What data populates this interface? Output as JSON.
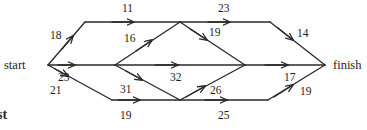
{
  "diagram": {
    "stroke_color": "#2a2a2a",
    "background_color": "#ffffff",
    "nodes": [
      {
        "id": "start",
        "label": "start",
        "x": 48,
        "y": 65
      },
      {
        "id": "top_left",
        "label": "",
        "x": 85,
        "y": 22
      },
      {
        "id": "mid_left",
        "label": "",
        "x": 115,
        "y": 65
      },
      {
        "id": "bottom_left",
        "label": "",
        "x": 112,
        "y": 100
      },
      {
        "id": "top_mid",
        "label": "",
        "x": 180,
        "y": 22
      },
      {
        "id": "bottom_mid",
        "label": "",
        "x": 180,
        "y": 100
      },
      {
        "id": "mid_right",
        "label": "",
        "x": 245,
        "y": 65
      },
      {
        "id": "top_right",
        "label": "",
        "x": 270,
        "y": 22
      },
      {
        "id": "bottom_right",
        "label": "",
        "x": 268,
        "y": 100
      },
      {
        "id": "finish",
        "label": "finish",
        "x": 325,
        "y": 65
      }
    ],
    "edges": [
      {
        "id": "e18",
        "from": "start",
        "to": "top_left",
        "weight": "18",
        "label_x": 50,
        "label_y": 30
      },
      {
        "id": "e23a",
        "from": "start",
        "to": "mid_left",
        "weight": "23",
        "label_x": 58,
        "label_y": 72
      },
      {
        "id": "e21",
        "from": "start",
        "to": "bottom_left",
        "weight": "21",
        "label_x": 50,
        "label_y": 85
      },
      {
        "id": "e11",
        "from": "top_left",
        "to": "top_mid",
        "weight": "11",
        "label_x": 122,
        "label_y": 3
      },
      {
        "id": "e16",
        "from": "mid_left",
        "to": "top_mid",
        "weight": "16",
        "label_x": 124,
        "label_y": 33
      },
      {
        "id": "e32",
        "from": "mid_left",
        "to": "mid_right",
        "weight": "32",
        "label_x": 170,
        "label_y": 72
      },
      {
        "id": "e31",
        "from": "mid_left",
        "to": "bottom_mid",
        "weight": "31",
        "label_x": 120,
        "label_y": 84
      },
      {
        "id": "e19b",
        "from": "bottom_left",
        "to": "bottom_mid",
        "weight": "19",
        "label_x": 120,
        "label_y": 110
      },
      {
        "id": "e23b",
        "from": "top_mid",
        "to": "top_right",
        "weight": "23",
        "label_x": 218,
        "label_y": 3
      },
      {
        "id": "e19a",
        "from": "top_mid",
        "to": "mid_right",
        "weight": "19",
        "label_x": 209,
        "label_y": 27
      },
      {
        "id": "e26",
        "from": "bottom_mid",
        "to": "mid_right",
        "weight": "26",
        "label_x": 210,
        "label_y": 85
      },
      {
        "id": "e25",
        "from": "bottom_mid",
        "to": "bottom_right",
        "weight": "25",
        "label_x": 218,
        "label_y": 110
      },
      {
        "id": "e14",
        "from": "top_right",
        "to": "finish",
        "weight": "14",
        "label_x": 297,
        "label_y": 28
      },
      {
        "id": "e17",
        "from": "mid_right",
        "to": "finish",
        "weight": "17",
        "label_x": 284,
        "label_y": 72
      },
      {
        "id": "e19c",
        "from": "bottom_right",
        "to": "finish",
        "weight": "19",
        "label_x": 300,
        "label_y": 86
      }
    ],
    "corner_text": "st"
  }
}
